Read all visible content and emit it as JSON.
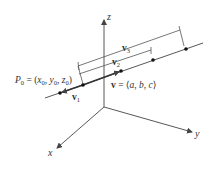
{
  "diagram": {
    "axes": {
      "x_label": "x",
      "y_label": "y",
      "z_label": "z"
    },
    "point_label": {
      "name": "P",
      "name_sub": "0",
      "eq": " = (",
      "x": "x",
      "x_sub": "0",
      "y": "y",
      "y_sub": "0",
      "z": "z",
      "z_sub": "0",
      "close": ")",
      "comma": ", "
    },
    "direction_label": {
      "v": "v",
      "eq": " = ⟨",
      "a": "a",
      "b": "b",
      "c": "c",
      "comma": ", ",
      "close": "⟩"
    },
    "vectors": [
      {
        "name": "v",
        "sub": "1"
      },
      {
        "name": "v",
        "sub": "2"
      },
      {
        "name": "v",
        "sub": "3"
      }
    ],
    "colors": {
      "line": "#444444",
      "text": "#333333",
      "background": "#ffffff"
    }
  }
}
